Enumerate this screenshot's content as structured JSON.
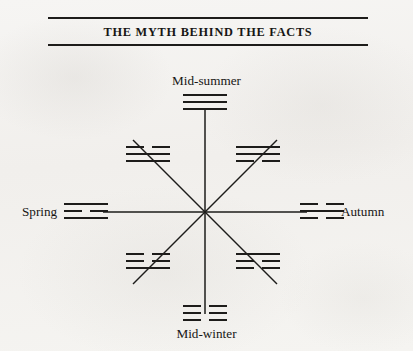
{
  "page": {
    "background_color": "#f4f3f1",
    "ink_color": "#1d1c1a"
  },
  "title_block": {
    "title": "THE MYTH BEHIND THE FACTS",
    "rule_above": true,
    "rule_below": true
  },
  "diagram": {
    "type": "eight-spoked-seasonal-wheel",
    "center": {
      "x": 205,
      "y": 212
    },
    "spoke_count": 8,
    "labels": {
      "top": "Mid-summer",
      "bottom": "Mid-winter",
      "left": "Spring",
      "right": "Autumn"
    },
    "trigrams": [
      {
        "position": "top",
        "name": "trigram-top",
        "season": "Mid-summer",
        "lines": [
          "solid",
          "solid",
          "solid"
        ]
      },
      {
        "position": "top-left",
        "name": "trigram-top-left",
        "season": "",
        "lines": [
          "broken",
          "solid",
          "solid"
        ]
      },
      {
        "position": "top-right",
        "name": "trigram-top-right",
        "season": "",
        "lines": [
          "solid",
          "solid",
          "broken"
        ]
      },
      {
        "position": "left",
        "name": "trigram-left",
        "season": "Spring",
        "lines": [
          "solid",
          "broken",
          "solid"
        ]
      },
      {
        "position": "right",
        "name": "trigram-right",
        "season": "Autumn",
        "lines": [
          "broken",
          "solid",
          "broken"
        ]
      },
      {
        "position": "bottom-left",
        "name": "trigram-bottom-left",
        "season": "",
        "lines": [
          "broken",
          "broken",
          "solid"
        ]
      },
      {
        "position": "bottom-right",
        "name": "trigram-bottom-right",
        "season": "",
        "lines": [
          "solid",
          "broken",
          "broken"
        ]
      },
      {
        "position": "bottom",
        "name": "trigram-bottom",
        "season": "Mid-winter",
        "lines": [
          "broken",
          "broken",
          "broken"
        ]
      }
    ]
  }
}
